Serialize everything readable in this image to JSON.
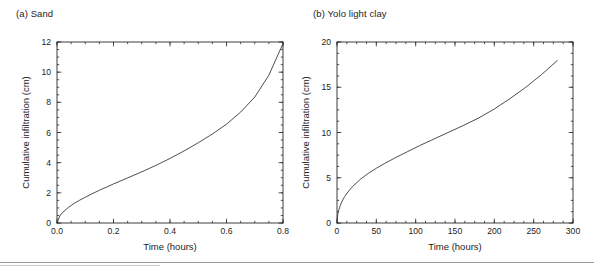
{
  "figure": {
    "background_color": "#ffffff",
    "line_color": "#3a3a3a",
    "axis_color": "#2b2b2b",
    "text_color": "#232323"
  },
  "panels": [
    {
      "caption": "(a) Sand",
      "xlabel": "Time (hours)",
      "ylabel": "Cumulative infiltration (cm)",
      "xticks": [
        "0.0",
        "0.2",
        "0.4",
        "0.6",
        "0.8"
      ],
      "yticks": [
        "0",
        "2",
        "4",
        "6",
        "8",
        "10",
        "12"
      ]
    },
    {
      "caption": "(b) Yolo light clay",
      "xlabel": "Time (hours)",
      "ylabel": "Cumulative infiltration (cm)",
      "xticks": [
        "0",
        "50",
        "100",
        "150",
        "200",
        "250",
        "300"
      ],
      "yticks": [
        "0",
        "5",
        "10",
        "15",
        "20"
      ]
    }
  ],
  "chart_data": [
    {
      "type": "line",
      "title": "(a) Sand",
      "xlabel": "Time (hours)",
      "ylabel": "Cumulative infiltration (cm)",
      "xlim": [
        0.0,
        0.8
      ],
      "ylim": [
        0,
        12
      ],
      "xticks": [
        0.0,
        0.2,
        0.4,
        0.6,
        0.8
      ],
      "yticks": [
        0,
        2,
        4,
        6,
        8,
        10,
        12
      ],
      "xminor_step": 0.05,
      "yminor_step": 0.5,
      "grid": false,
      "legend": null,
      "series": [
        {
          "name": "Sand cumulative infiltration",
          "x": [
            0.0,
            0.01,
            0.02,
            0.04,
            0.06,
            0.08,
            0.1,
            0.12,
            0.15,
            0.18,
            0.2,
            0.25,
            0.3,
            0.35,
            0.4,
            0.45,
            0.5,
            0.55,
            0.6,
            0.65,
            0.7,
            0.75,
            0.8
          ],
          "y": [
            0.0,
            0.47,
            0.7,
            1.03,
            1.29,
            1.51,
            1.71,
            1.9,
            2.17,
            2.42,
            2.59,
            2.99,
            3.39,
            3.82,
            4.28,
            4.78,
            5.32,
            5.9,
            6.55,
            7.35,
            8.35,
            9.8,
            11.9
          ]
        }
      ]
    },
    {
      "type": "line",
      "title": "(b) Yolo light clay",
      "xlabel": "Time (hours)",
      "ylabel": "Cumulative infiltration (cm)",
      "xlim": [
        0,
        300
      ],
      "ylim": [
        0,
        20
      ],
      "xticks": [
        0,
        50,
        100,
        150,
        200,
        250,
        300
      ],
      "yticks": [
        0,
        5,
        10,
        15,
        20
      ],
      "xminor_step": 12.5,
      "yminor_step": 1.25,
      "grid": false,
      "legend": null,
      "series": [
        {
          "name": "Yolo light clay cumulative infiltration",
          "x": [
            0,
            1,
            2,
            4,
            6,
            8,
            10,
            15,
            20,
            30,
            40,
            50,
            60,
            75,
            90,
            105,
            120,
            140,
            160,
            180,
            200,
            220,
            240,
            260,
            280
          ],
          "y": [
            0.0,
            0.95,
            1.35,
            1.9,
            2.32,
            2.66,
            2.95,
            3.55,
            4.05,
            4.85,
            5.5,
            6.05,
            6.55,
            7.25,
            7.9,
            8.55,
            9.15,
            9.95,
            10.75,
            11.6,
            12.6,
            13.75,
            15.0,
            16.4,
            17.95
          ]
        }
      ]
    }
  ]
}
